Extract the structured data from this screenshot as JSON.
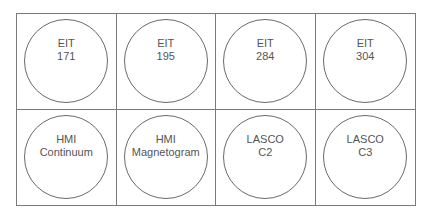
{
  "cells": [
    {
      "line1": "EIT",
      "line2": "171"
    },
    {
      "line1": "EIT",
      "line2": "195"
    },
    {
      "line1": "EIT",
      "line2": "284"
    },
    {
      "line1": "EIT",
      "line2": "304"
    },
    {
      "line1": "HMI",
      "line2": "Continuum"
    },
    {
      "line1": "HMI",
      "line2": "Magnetogram"
    },
    {
      "line1": "LASCO",
      "line2": "C2"
    },
    {
      "line1": "LASCO",
      "line2": "C3"
    }
  ]
}
